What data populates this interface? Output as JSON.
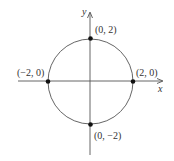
{
  "diagram": {
    "type": "circle-on-axes",
    "equation_implied": "x^2 + y^2 = 4",
    "center": [
      0,
      0
    ],
    "radius": 2,
    "axes": {
      "x_label": "x",
      "y_label": "y"
    },
    "points": [
      {
        "name": "top",
        "label": "(0, 2)",
        "x": 0,
        "y": 2
      },
      {
        "name": "right",
        "label": "(2, 0)",
        "x": 2,
        "y": 0
      },
      {
        "name": "bottom",
        "label": "(0, −2)",
        "x": 0,
        "y": -2
      },
      {
        "name": "left",
        "label": "(−2, 0)",
        "x": -2,
        "y": 0
      }
    ],
    "colors": {
      "axis": "#555555",
      "circle": "#666666",
      "point": "#111111",
      "text": "#333333"
    }
  }
}
